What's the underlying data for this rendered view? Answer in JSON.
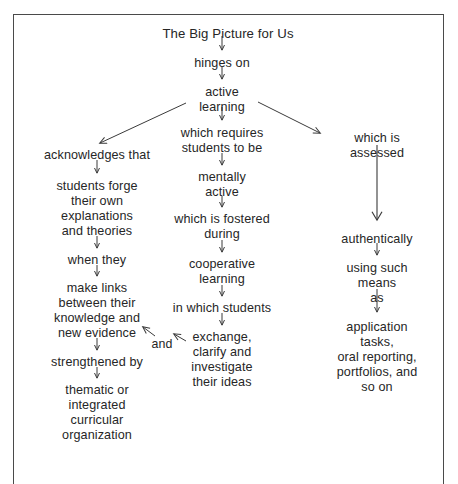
{
  "figure": {
    "title": "The Big Picture for Us",
    "kind": "concept-map",
    "frame_color": "#4a4a4a",
    "text_color": "#262626",
    "background": "#ffffff"
  },
  "nodes": {
    "title": {
      "text": "The Big Picture for Us",
      "x": 228,
      "y": 26
    },
    "hinges_on": {
      "text": "hinges on",
      "x": 222,
      "y": 56
    },
    "active_learning": {
      "text": "active\nlearning",
      "x": 222,
      "y": 85
    },
    "acknowledges": {
      "text": "acknowledges that",
      "x": 97,
      "y": 148
    },
    "students_forge": {
      "text": "students forge\ntheir own\nexplanations\nand theories",
      "x": 97,
      "y": 179
    },
    "when_they": {
      "text": "when they",
      "x": 97,
      "y": 253
    },
    "make_links": {
      "text": "make links\nbetween their\nknowledge and\nnew evidence",
      "x": 97,
      "y": 281
    },
    "strengthened_by": {
      "text": "strengthened by",
      "x": 97,
      "y": 355
    },
    "thematic": {
      "text": "thematic or\nintegrated\ncurricular\norganization",
      "x": 97,
      "y": 383
    },
    "which_requires": {
      "text": "which requires\nstudents to be",
      "x": 222,
      "y": 126
    },
    "mentally_active": {
      "text": "mentally\nactive",
      "x": 222,
      "y": 170
    },
    "fostered_during": {
      "text": "which is fostered\nduring",
      "x": 222,
      "y": 212
    },
    "cooperative": {
      "text": "cooperative\nlearning",
      "x": 222,
      "y": 257
    },
    "in_which": {
      "text": "in which students",
      "x": 222,
      "y": 301
    },
    "exchange": {
      "text": "exchange,\nclarify and\ninvestigate\ntheir ideas",
      "x": 222,
      "y": 330
    },
    "and_connector": {
      "text": "and",
      "x": 162,
      "y": 337
    },
    "which_assessed": {
      "text": "which is assessed",
      "x": 377,
      "y": 131
    },
    "authentically": {
      "text": "authentically",
      "x": 377,
      "y": 232
    },
    "using_such_means": {
      "text": "using such means\nas",
      "x": 377,
      "y": 261
    },
    "outcomes": {
      "text": "application tasks,\noral reporting,\nportfolios, and so on",
      "x": 377,
      "y": 320
    }
  },
  "arrows": [
    {
      "name": "title-to-hinges-on",
      "kind": "down",
      "x1": 222,
      "y1": 36,
      "x2": 222,
      "y2": 50
    },
    {
      "name": "hinges-on-to-active-learning",
      "kind": "down",
      "x1": 222,
      "y1": 66,
      "x2": 222,
      "y2": 79
    },
    {
      "name": "active-learning-to-acknowledges",
      "kind": "diag",
      "x1": 186,
      "y1": 103,
      "x2": 100,
      "y2": 143
    },
    {
      "name": "active-learning-to-requires",
      "kind": "down",
      "x1": 222,
      "y1": 107,
      "x2": 222,
      "y2": 120
    },
    {
      "name": "active-learning-to-assessed",
      "kind": "diag",
      "x1": 258,
      "y1": 102,
      "x2": 320,
      "y2": 133
    },
    {
      "name": "acknowledges-to-students-forge",
      "kind": "down",
      "x1": 97,
      "y1": 160,
      "x2": 97,
      "y2": 173
    },
    {
      "name": "students-forge-to-when-they",
      "kind": "down",
      "x1": 97,
      "y1": 236,
      "x2": 97,
      "y2": 248
    },
    {
      "name": "when-they-to-make-links",
      "kind": "down",
      "x1": 97,
      "y1": 265,
      "x2": 97,
      "y2": 276
    },
    {
      "name": "make-links-to-strengthened-by",
      "kind": "down",
      "x1": 97,
      "y1": 338,
      "x2": 97,
      "y2": 350
    },
    {
      "name": "strengthened-by-to-thematic",
      "kind": "down",
      "x1": 97,
      "y1": 367,
      "x2": 97,
      "y2": 378
    },
    {
      "name": "requires-to-mentally-active",
      "kind": "down",
      "x1": 222,
      "y1": 153,
      "x2": 222,
      "y2": 165
    },
    {
      "name": "mentally-active-to-fostered",
      "kind": "down",
      "x1": 222,
      "y1": 196,
      "x2": 222,
      "y2": 207
    },
    {
      "name": "fostered-to-cooperative",
      "kind": "down",
      "x1": 222,
      "y1": 240,
      "x2": 222,
      "y2": 252
    },
    {
      "name": "cooperative-to-in-which",
      "kind": "down",
      "x1": 222,
      "y1": 285,
      "x2": 222,
      "y2": 296
    },
    {
      "name": "in-which-to-exchange",
      "kind": "down",
      "x1": 222,
      "y1": 313,
      "x2": 222,
      "y2": 325
    },
    {
      "name": "exchange-to-and",
      "kind": "diag",
      "x1": 186,
      "y1": 341,
      "x2": 174,
      "y2": 334
    },
    {
      "name": "and-to-new-evidence",
      "kind": "diag",
      "x1": 155,
      "y1": 336,
      "x2": 143,
      "y2": 327
    },
    {
      "name": "assessed-to-authentically",
      "kind": "long",
      "x1": 377,
      "y1": 145,
      "x2": 377,
      "y2": 220
    },
    {
      "name": "authentically-to-using-means",
      "kind": "down",
      "x1": 377,
      "y1": 243,
      "x2": 377,
      "y2": 255
    },
    {
      "name": "using-means-to-outcomes",
      "kind": "down",
      "x1": 377,
      "y1": 289,
      "x2": 377,
      "y2": 312
    }
  ]
}
